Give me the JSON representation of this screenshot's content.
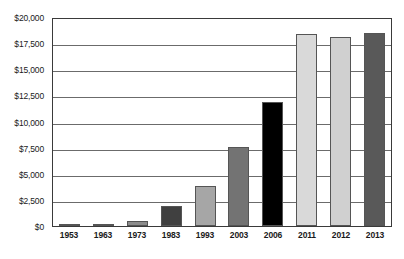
{
  "chart_data": {
    "type": "bar",
    "title": "",
    "subtitle": "",
    "xlabel": "",
    "ylabel": "",
    "categories": [
      "1953",
      "1963",
      "1973",
      "1983",
      "1993",
      "2003",
      "2006",
      "2011",
      "2012",
      "2013"
    ],
    "values": [
      100,
      200,
      450,
      1950,
      3800,
      7600,
      11900,
      18400,
      18100,
      18500
    ],
    "ylim": [
      0,
      20000
    ],
    "y_ticks": [
      0,
      2500,
      5000,
      7500,
      10000,
      12500,
      15000,
      17500,
      20000
    ],
    "y_tick_labels": [
      "$0",
      "$2,500",
      "$5,000",
      "$7,500",
      "$10,000",
      "$12,500",
      "$15,000",
      "$17,500",
      "$20,000"
    ],
    "grid": true,
    "legend": "none",
    "bar_colors": [
      "#bfbfbf",
      "#d9d9d9",
      "#8c8c8c",
      "#404040",
      "#a6a6a6",
      "#737373",
      "#000000",
      "#d9d9d9",
      "#d0d0d0",
      "#595959"
    ],
    "bar_border_color": "#555555",
    "axis_color": "#3a3a3a",
    "gridline_color": "#6b6b6b",
    "background_color": "#ffffff",
    "text_color": "#1a1a1a"
  },
  "axes": {
    "y_labels": [
      {
        "value": 20000,
        "text": "$20,000"
      },
      {
        "value": 17500,
        "text": "$17,500"
      },
      {
        "value": 15000,
        "text": "$15,000"
      },
      {
        "value": 12500,
        "text": "$12,500"
      },
      {
        "value": 10000,
        "text": "$10,000"
      },
      {
        "value": 7500,
        "text": "$7,500"
      },
      {
        "value": 5000,
        "text": "$5,000"
      },
      {
        "value": 2500,
        "text": "$2,500"
      },
      {
        "value": 0,
        "text": "$0"
      }
    ],
    "x_labels": [
      {
        "text": "1953"
      },
      {
        "text": "1963"
      },
      {
        "text": "1973"
      },
      {
        "text": "1983"
      },
      {
        "text": "1993"
      },
      {
        "text": "2003"
      },
      {
        "text": "2006"
      },
      {
        "text": "2011"
      },
      {
        "text": "2012"
      },
      {
        "text": "2013"
      }
    ]
  }
}
